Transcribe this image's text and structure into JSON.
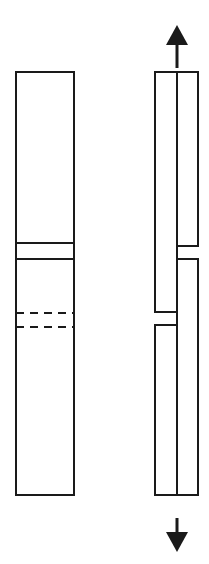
{
  "figure": {
    "canvas": {
      "width": 209,
      "height": 564
    },
    "stroke_color": "#1a1a1a",
    "background_color": "#ffffff"
  },
  "left_panel": {
    "name": "intact-specimen",
    "outline": {
      "x": 16,
      "y": 72,
      "width": 58,
      "height": 423
    },
    "solid_bands": [
      {
        "name": "upper-band-line",
        "y": 243
      },
      {
        "name": "lower-band-line",
        "y": 259
      }
    ],
    "dashed_bands": [
      {
        "name": "upper-dashed-line",
        "y": 313
      },
      {
        "name": "lower-dashed-line",
        "y": 327
      }
    ]
  },
  "right_panel": {
    "name": "separated-specimen",
    "left_column": {
      "name": "left-segment-column",
      "x": 155,
      "width": 22,
      "top": 72,
      "bottom": 495,
      "break_start": 312,
      "break_end": 325
    },
    "right_column": {
      "name": "right-segment-column",
      "x": 177,
      "width": 21,
      "top": 72,
      "bottom": 495,
      "break_start": 246,
      "break_end": 259
    }
  },
  "arrows": {
    "top": {
      "name": "tension-arrow-up",
      "direction": "up",
      "center_x": 177,
      "tip_y": 25,
      "head_base_y": 45,
      "shaft_end_y": 68,
      "head_half_width": 11
    },
    "bottom": {
      "name": "tension-arrow-down",
      "direction": "down",
      "center_x": 177,
      "tip_y": 552,
      "head_base_y": 532,
      "shaft_start_y": 518,
      "head_half_width": 11
    }
  }
}
